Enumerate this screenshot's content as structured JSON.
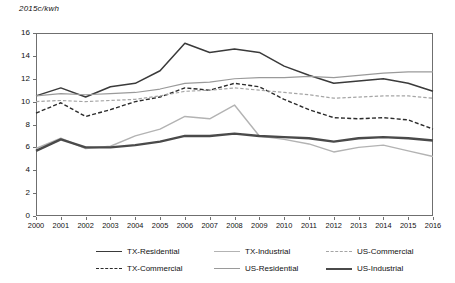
{
  "chart": {
    "y_axis_title": "2015c/kwh",
    "y_ticks": [
      "0",
      "2",
      "4",
      "6",
      "8",
      "10",
      "12",
      "14",
      "16"
    ],
    "x_ticks": [
      "2000",
      "2001",
      "2002",
      "2003",
      "2004",
      "2005",
      "2006",
      "2007",
      "2008",
      "2009",
      "2010",
      "2011",
      "2012",
      "2013",
      "2014",
      "2015",
      "2016"
    ]
  },
  "legend": {
    "items": [
      {
        "label": "TX-Residential",
        "color": "#3a3a3a",
        "style": "solid",
        "width": 1.5
      },
      {
        "label": "TX-Commercial",
        "color": "#2b2b2b",
        "style": "dashed",
        "width": 1.4
      },
      {
        "label": "TX-Industrial",
        "color": "#b3b3b3",
        "style": "solid",
        "width": 1.4
      },
      {
        "label": "US-Residential",
        "color": "#9a9a9a",
        "style": "solid",
        "width": 1.2
      },
      {
        "label": "US-Commercial",
        "color": "#a5a5a5",
        "style": "dashed",
        "width": 1.2
      },
      {
        "label": "US-Industrial",
        "color": "#4a4a4a",
        "style": "solid",
        "width": 2.4
      }
    ]
  },
  "chart_data": {
    "type": "line",
    "title": "",
    "xlabel": "",
    "ylabel": "2015c/kwh",
    "grid": false,
    "legend_position": "bottom",
    "xlim": [
      2000,
      2016
    ],
    "ylim": [
      0,
      16
    ],
    "ytick_step": 2,
    "x": [
      2000,
      2001,
      2002,
      2003,
      2004,
      2005,
      2006,
      2007,
      2008,
      2009,
      2010,
      2011,
      2012,
      2013,
      2014,
      2015,
      2016
    ],
    "series": [
      {
        "name": "TX-Residential",
        "color": "#3a3a3a",
        "style": "solid",
        "values": [
          10.5,
          11.2,
          10.4,
          11.3,
          11.6,
          12.7,
          15.1,
          14.3,
          14.6,
          14.3,
          13.1,
          12.3,
          11.6,
          11.8,
          12.0,
          11.6,
          10.9
        ]
      },
      {
        "name": "TX-Commercial",
        "color": "#2b2b2b",
        "style": "dashed",
        "values": [
          9.0,
          9.9,
          8.7,
          9.3,
          10.0,
          10.4,
          11.2,
          11.0,
          11.6,
          11.3,
          10.2,
          9.3,
          8.6,
          8.5,
          8.6,
          8.4,
          7.6
        ]
      },
      {
        "name": "TX-Industrial",
        "color": "#b3b3b3",
        "style": "solid",
        "values": [
          5.9,
          6.8,
          5.9,
          6.1,
          7.0,
          7.6,
          8.7,
          8.5,
          9.7,
          7.0,
          6.7,
          6.3,
          5.6,
          6.0,
          6.2,
          5.7,
          5.2
        ]
      },
      {
        "name": "US-Residential",
        "color": "#9a9a9a",
        "style": "solid",
        "values": [
          10.5,
          10.7,
          10.6,
          10.7,
          10.8,
          11.1,
          11.6,
          11.7,
          12.0,
          12.1,
          12.1,
          12.2,
          12.1,
          12.3,
          12.5,
          12.6,
          12.6
        ]
      },
      {
        "name": "US-Commercial",
        "color": "#a5a5a5",
        "style": "dashed",
        "values": [
          10.0,
          10.1,
          10.0,
          10.1,
          10.2,
          10.5,
          10.9,
          11.0,
          11.2,
          11.0,
          10.8,
          10.6,
          10.3,
          10.4,
          10.5,
          10.5,
          10.3
        ]
      },
      {
        "name": "US-Industrial",
        "color": "#4a4a4a",
        "style": "solid",
        "values": [
          5.7,
          6.7,
          6.0,
          6.0,
          6.2,
          6.5,
          7.0,
          7.0,
          7.2,
          7.0,
          6.9,
          6.8,
          6.5,
          6.8,
          6.9,
          6.8,
          6.6
        ]
      }
    ]
  }
}
